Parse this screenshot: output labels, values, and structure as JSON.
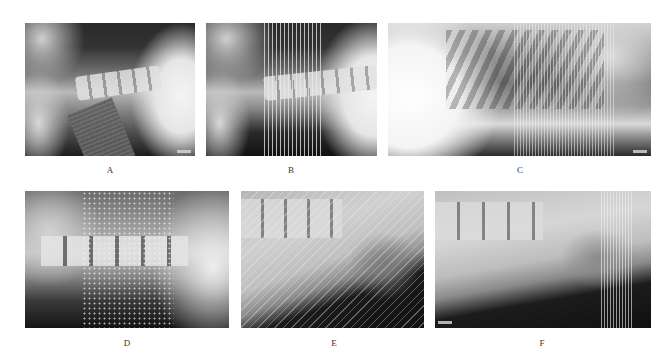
{
  "figure": {
    "panels": [
      {
        "id": "A",
        "label": "A",
        "description": "lateral cervical radiograph with diagonal band artifact"
      },
      {
        "id": "B",
        "label": "B",
        "description": "lateral cervical radiograph with vertical line artifacts"
      },
      {
        "id": "C",
        "label": "C",
        "description": "lateral thoracic radiograph with vertical line artifacts"
      },
      {
        "id": "D",
        "label": "D",
        "description": "lateral lumbar radiograph with dotted grid artifact"
      },
      {
        "id": "E",
        "label": "E",
        "description": "lateral lumbosacral radiograph with diagonal hatch artifact"
      },
      {
        "id": "F",
        "label": "F",
        "description": "lateral lumbosacral radiograph with vertical line artifacts"
      }
    ]
  }
}
